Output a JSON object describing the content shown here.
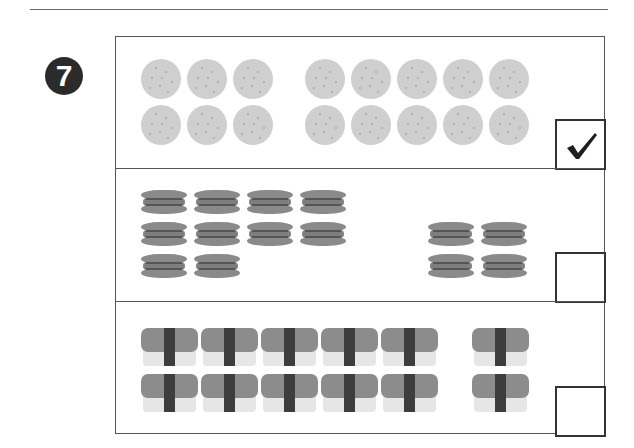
{
  "question": {
    "number": "7",
    "instruction_visible": false
  },
  "options": [
    {
      "id": "option-crackers",
      "item": "cracker",
      "icon": "round-cracker-icon",
      "groups": [
        {
          "count": 6,
          "rows": 2,
          "cols": 3
        },
        {
          "count": 10,
          "rows": 2,
          "cols": 5
        }
      ],
      "checked": true,
      "check_mark": "✓"
    },
    {
      "id": "option-sandwich-cookies",
      "item": "sandwich cookie",
      "icon": "sandwich-cookie-icon",
      "groups": [
        {
          "count": 10,
          "rows": 3,
          "cols": 4
        },
        {
          "count": 4,
          "rows": 2,
          "cols": 2
        }
      ],
      "checked": false,
      "check_mark": ""
    },
    {
      "id": "option-sushi",
      "item": "sushi",
      "icon": "sushi-icon",
      "groups": [
        {
          "count": 10,
          "rows": 2,
          "cols": 5
        },
        {
          "count": 2,
          "rows": 2,
          "cols": 1
        }
      ],
      "checked": false,
      "check_mark": ""
    }
  ],
  "colors": {
    "badge": "#2b2b2b",
    "cracker": "#cfcfcf",
    "cookie": "#8a8a8a",
    "sushi_fish": "#8c8c8c",
    "sushi_nori": "#3d3d3d",
    "sushi_rice": "#e6e6e6",
    "border": "#555555"
  }
}
